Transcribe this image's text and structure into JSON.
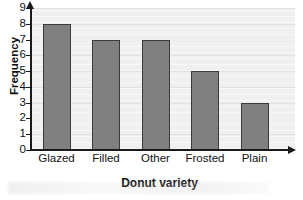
{
  "chart_data": {
    "type": "bar",
    "title": "",
    "xlabel": "Donut variety",
    "ylabel": "Frequency",
    "categories": [
      "Glazed",
      "Filled",
      "Other",
      "Frosted",
      "Plain"
    ],
    "values": [
      8,
      7,
      7,
      5,
      3
    ],
    "ylim": [
      0,
      9
    ],
    "yticks": [
      "0",
      "1",
      "2",
      "3",
      "4",
      "5",
      "6",
      "7",
      "8",
      "9"
    ],
    "grid": true,
    "legend": false,
    "colors": {
      "bar_fill": "#808080",
      "bar_edge": "#3b3b3b",
      "plot_background": "#f0f0f0",
      "gridline": "#e0e0e0",
      "axis": "#1a1a1a",
      "text": "#111111"
    }
  }
}
